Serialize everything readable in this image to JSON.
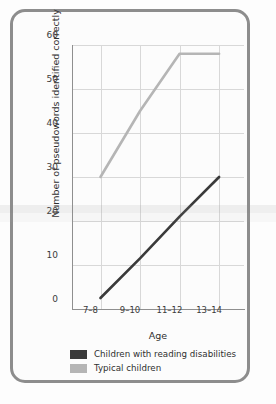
{
  "chart_data": {
    "type": "line",
    "title": "",
    "xlabel": "Age",
    "ylabel": "Number of pseudowords identified correctly",
    "categories": [
      "7–8",
      "9–10",
      "11–12",
      "13–14"
    ],
    "series": [
      {
        "name": "Children with reading disabilities",
        "color": "#3a3a3a",
        "values": [
          2.5,
          11.5,
          21,
          30
        ]
      },
      {
        "name": "Typical children",
        "color": "#b5b5b5",
        "values": [
          30,
          45,
          58,
          58
        ]
      }
    ],
    "ylim": [
      0,
      60
    ],
    "yticks": [
      0,
      10,
      20,
      30,
      40,
      50,
      60
    ],
    "ytick_labels": [
      "0",
      "10",
      "20",
      "30",
      "40",
      "50",
      "60"
    ],
    "grid": true,
    "legend_position": "bottom-left"
  },
  "legend": {
    "items": [
      {
        "label": "Children with reading disabilities",
        "color": "#3a3a3a"
      },
      {
        "label": "Typical children",
        "color": "#b5b5b5"
      }
    ]
  },
  "colors": {
    "frame": "#8d8d8d",
    "grid": "#d8d8d8",
    "axis": "#8f8f8f",
    "background": "#fcfcfc",
    "series_dark": "#3a3a3a",
    "series_light": "#b5b5b5"
  }
}
